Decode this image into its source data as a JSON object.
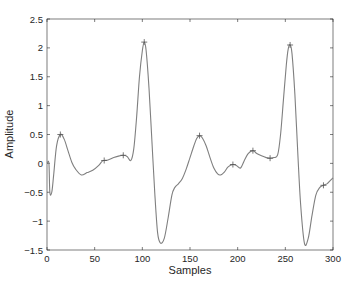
{
  "chart_data": {
    "type": "line",
    "title": "",
    "xlabel": "Samples",
    "ylabel": "Amplitude",
    "xlim": [
      0,
      300
    ],
    "ylim": [
      -1.5,
      2.5
    ],
    "xticks": [
      0,
      50,
      100,
      150,
      200,
      250,
      300
    ],
    "yticks": [
      -1.5,
      -1,
      -0.5,
      0,
      0.5,
      1,
      1.5,
      2,
      2.5
    ],
    "xtick_labels": [
      "0",
      "50",
      "100",
      "150",
      "200",
      "250",
      "300"
    ],
    "ytick_labels": [
      "-1.5",
      "-1",
      "-0.5",
      "0",
      "0.5",
      "1",
      "1.5",
      "2",
      "2.5"
    ],
    "grid": false,
    "legend": null,
    "line_color": "#7f7f7f",
    "series": [
      {
        "name": "signal",
        "x": [
          0,
          2,
          3,
          5,
          7,
          10,
          14,
          18,
          22,
          26,
          30,
          36,
          42,
          48,
          54,
          58,
          60,
          64,
          70,
          76,
          80,
          84,
          88,
          91,
          94,
          97,
          100,
          102,
          104,
          107,
          110,
          113,
          116,
          119,
          123,
          127,
          131,
          134,
          138,
          142,
          146,
          150,
          154,
          157,
          160,
          163,
          167,
          171,
          175,
          179,
          182,
          186,
          190,
          195,
          199,
          203,
          207,
          211,
          216,
          220,
          225,
          230,
          234,
          238,
          242,
          245,
          248,
          251,
          253,
          255,
          257,
          260,
          263,
          266,
          270,
          274,
          278,
          282,
          286,
          290,
          294,
          297,
          300
        ],
        "y": [
          0,
          0,
          -0.5,
          -0.5,
          -0.2,
          0.3,
          0.5,
          0.42,
          0.22,
          0.02,
          -0.1,
          -0.2,
          -0.16,
          -0.12,
          -0.04,
          0.04,
          0.05,
          0.06,
          0.1,
          0.13,
          0.14,
          0.12,
          0.05,
          0.25,
          0.8,
          1.5,
          1.95,
          2.1,
          1.95,
          1.3,
          0.4,
          -0.5,
          -1.2,
          -1.38,
          -1.3,
          -0.95,
          -0.55,
          -0.42,
          -0.35,
          -0.26,
          -0.1,
          0.1,
          0.3,
          0.43,
          0.48,
          0.44,
          0.3,
          0.1,
          -0.08,
          -0.18,
          -0.2,
          -0.15,
          -0.06,
          -0.02,
          -0.04,
          -0.08,
          0.05,
          0.17,
          0.22,
          0.17,
          0.13,
          0.1,
          0.09,
          0.1,
          0.15,
          0.5,
          1.1,
          1.7,
          1.98,
          2.05,
          1.9,
          1.2,
          0.2,
          -0.7,
          -1.38,
          -1.3,
          -0.9,
          -0.55,
          -0.42,
          -0.38,
          -0.35,
          -0.3,
          -0.25
        ]
      }
    ],
    "markers": {
      "symbol": "+",
      "points": [
        {
          "x": 14,
          "y": 0.5
        },
        {
          "x": 60,
          "y": 0.05
        },
        {
          "x": 80,
          "y": 0.14
        },
        {
          "x": 102,
          "y": 2.1
        },
        {
          "x": 160,
          "y": 0.48
        },
        {
          "x": 195,
          "y": -0.02
        },
        {
          "x": 216,
          "y": 0.22
        },
        {
          "x": 234,
          "y": 0.09
        },
        {
          "x": 255,
          "y": 2.05
        },
        {
          "x": 290,
          "y": -0.38
        }
      ]
    }
  }
}
